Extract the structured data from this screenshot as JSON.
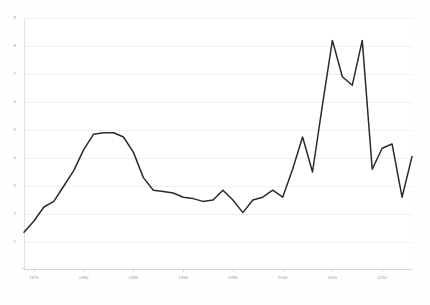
{
  "chart_data": {
    "type": "line",
    "title": "",
    "subtitle": "",
    "xlabel": "",
    "ylabel": "",
    "grid": true,
    "legend": false,
    "legend_position": "none",
    "line_color": "#2b2b2b",
    "background_color": "#ffffff",
    "gridline_color": "#f0f0f0",
    "xlim": [
      1974,
      2013
    ],
    "ylim": [
      0,
      9
    ],
    "yticks": [
      1,
      2,
      3,
      4,
      5,
      6,
      7,
      8,
      9
    ],
    "ytick_labels": [
      "1",
      "2",
      "3",
      "4",
      "5",
      "6",
      "7",
      "8",
      "9"
    ],
    "xticks": [
      1975,
      1980,
      1985,
      1990,
      1995,
      2000,
      2005,
      2010
    ],
    "xtick_labels": [
      "1975",
      "1980",
      "1985",
      "1990",
      "1995",
      "2000",
      "2005",
      "2010"
    ],
    "series": [
      {
        "name": "series-1",
        "x": [
          1974,
          1975,
          1976,
          1977,
          1978,
          1979,
          1980,
          1981,
          1982,
          1983,
          1984,
          1985,
          1986,
          1987,
          1988,
          1989,
          1990,
          1991,
          1992,
          1993,
          1994,
          1995,
          1996,
          1997,
          1998,
          1999,
          2000,
          2001,
          2002,
          2003,
          2004,
          2005,
          2006,
          2007,
          2008,
          2009,
          2010,
          2011,
          2012,
          2013
        ],
        "values": [
          1.35,
          1.75,
          2.25,
          2.45,
          3.0,
          3.55,
          4.3,
          4.85,
          4.9,
          4.9,
          4.75,
          4.2,
          3.3,
          2.85,
          2.8,
          2.75,
          2.6,
          2.55,
          2.45,
          2.5,
          2.85,
          2.5,
          2.05,
          2.5,
          2.6,
          2.85,
          2.6,
          3.6,
          4.75,
          3.5,
          5.9,
          8.2,
          6.9,
          6.6,
          8.2,
          3.6,
          4.35,
          4.5,
          2.6,
          4.05
        ]
      }
    ]
  }
}
